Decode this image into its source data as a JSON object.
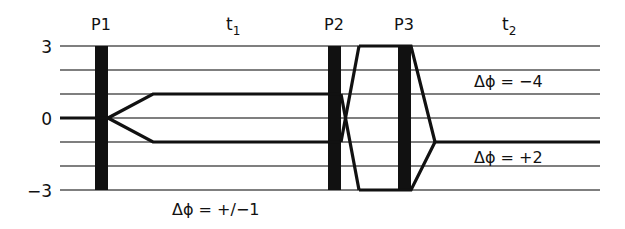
{
  "diagram": {
    "pulses": [
      {
        "label": "P1",
        "x": 101
      },
      {
        "label": "P2",
        "x": 334
      },
      {
        "label": "P3",
        "x": 404
      }
    ],
    "periods": [
      {
        "label": "t",
        "sub": "1",
        "x": 232
      },
      {
        "label": "t",
        "sub": "2",
        "x": 508
      }
    ],
    "y_ticks": [
      {
        "label": "3",
        "value": 3
      },
      {
        "label": "0",
        "value": 0
      },
      {
        "label": "−3",
        "value": -3
      }
    ],
    "levels": [
      3,
      2,
      1,
      0,
      -1,
      -2,
      -3
    ],
    "annotations": [
      {
        "id": "dphi_t1",
        "text": "Δϕ = +/−1"
      },
      {
        "id": "dphi_minus4",
        "text": "Δϕ = −4"
      },
      {
        "id": "dphi_plus2",
        "text": "Δϕ = +2"
      }
    ],
    "colors": {
      "line": "#111111",
      "grid": "#555555",
      "background": "#ffffff"
    }
  }
}
